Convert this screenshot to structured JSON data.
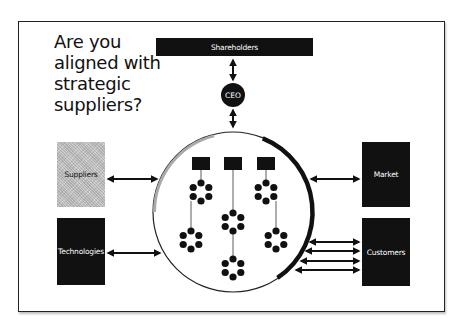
{
  "header_cut_text": "Aligning growth with strategic suppliers",
  "title_lines": [
    "Are you",
    "aligned with",
    "strategic",
    "suppliers?"
  ],
  "nodes": {
    "shareholders": "Shareholders",
    "ceo": "CEO",
    "suppliers": "Suppliers",
    "technologies": "Technologies",
    "market": "Market",
    "customers": "Customers"
  },
  "organization": {
    "divisions": 3,
    "clusters_per_column": [
      2,
      3,
      2
    ],
    "dots_per_cluster": 6
  },
  "connections": [
    {
      "from": "shareholders",
      "to": "ceo",
      "type": "bidirectional"
    },
    {
      "from": "ceo",
      "to": "organization",
      "type": "bidirectional"
    },
    {
      "from": "suppliers",
      "to": "organization",
      "type": "bidirectional"
    },
    {
      "from": "technologies",
      "to": "organization",
      "type": "bidirectional"
    },
    {
      "from": "market",
      "to": "organization",
      "type": "bidirectional"
    },
    {
      "from": "customers",
      "to": "organization",
      "type": "bidirectional",
      "count": 4
    }
  ],
  "colors": {
    "dark": "#111111",
    "supplier_fill": "#c4c4c4",
    "supplier_arc": "#aaaaaa",
    "text_light": "#ffffff",
    "text_dark": "#111111"
  }
}
